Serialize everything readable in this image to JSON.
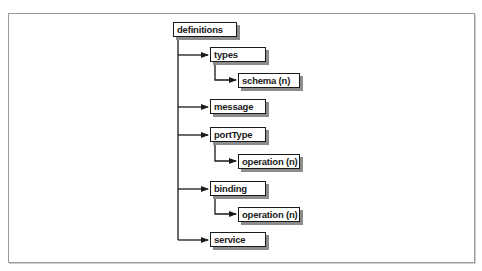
{
  "diagram": {
    "type": "tree",
    "root": {
      "label": "definitions",
      "children": [
        {
          "label": "types",
          "children": [
            {
              "label": "schema (n)"
            }
          ]
        },
        {
          "label": "message"
        },
        {
          "label": "portType",
          "children": [
            {
              "label": "operation (n)"
            }
          ]
        },
        {
          "label": "binding",
          "children": [
            {
              "label": "operation (n)"
            }
          ]
        },
        {
          "label": "service"
        }
      ]
    }
  },
  "nodes": {
    "definitions": "definitions",
    "types": "types",
    "schema": "schema (n)",
    "message": "message",
    "portType": "portType",
    "portType_operation": "operation (n)",
    "binding": "binding",
    "binding_operation": "operation (n)",
    "service": "service"
  },
  "colors": {
    "line": "#1a1a1a",
    "shadow": "#8c8c8c",
    "frame": "#9a9a9a"
  }
}
